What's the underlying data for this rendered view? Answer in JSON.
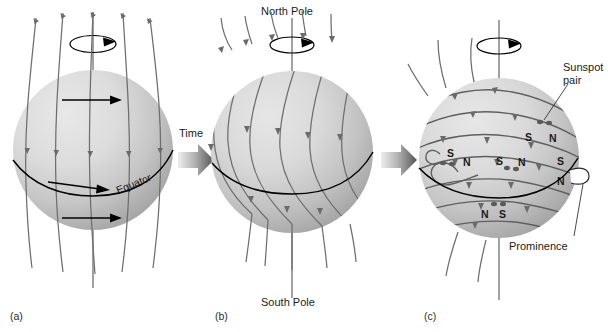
{
  "figure": {
    "background_color": "#ffffff",
    "sphere_color_light": "#e3e3e3",
    "sphere_color_dark": "#a8a8a8",
    "fieldline_color": "#6e6e6e",
    "equator_color": "#000000",
    "arrow_color_light": "#d8d8d8",
    "arrow_color_dark": "#5a5a5a"
  },
  "panels": [
    {
      "id": "a",
      "label": "(a)",
      "caption_equator": "Equator"
    },
    {
      "id": "b",
      "label": "(b)",
      "caption_north": "North Pole",
      "caption_south": "South Pole"
    },
    {
      "id": "c",
      "label": "(c)",
      "caption_sunspot_line1": "Sunspot",
      "caption_sunspot_line2": "pair",
      "caption_prominence": "Prominence"
    }
  ],
  "transitions": [
    {
      "label": "Time",
      "icon": "right-arrow-icon"
    },
    {
      "label": "",
      "icon": "right-arrow-icon"
    }
  ],
  "polarity_labels": {
    "row_north_high": [
      "S",
      "N"
    ],
    "row_mid_left": [
      "S",
      "N"
    ],
    "row_mid_center": [
      "S",
      "N"
    ],
    "row_mid_right": [
      "S",
      "N"
    ],
    "row_south": [
      "N",
      "S"
    ]
  }
}
